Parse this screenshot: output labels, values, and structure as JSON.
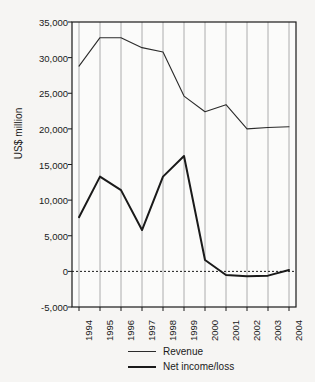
{
  "chart_data": {
    "type": "line",
    "title": "",
    "xlabel": "",
    "ylabel": "US$ million",
    "ylim": [
      -5000,
      35000
    ],
    "ytick_values": [
      35000,
      30000,
      25000,
      20000,
      15000,
      10000,
      5000,
      0,
      -5000
    ],
    "ytick_labels": [
      "35,000",
      "30,000",
      "25,000",
      "20,000",
      "15,000",
      "10,000",
      "5,000",
      "0",
      "-5,000"
    ],
    "categories": [
      "1994",
      "1995",
      "1996",
      "1997",
      "1998",
      "1999",
      "2000",
      "2001",
      "2002",
      "2003",
      "2004"
    ],
    "grid": "vertical",
    "zero_line": true,
    "legend_position": "bottom",
    "series": [
      {
        "name": "Revenue",
        "style": "thin",
        "color": "#2b2b2b",
        "values": [
          28800,
          32800,
          32800,
          31400,
          30800,
          24600,
          22400,
          23400,
          20000,
          20200,
          20300
        ]
      },
      {
        "name": "Net income/loss",
        "style": "thick",
        "color": "#1a1a1a",
        "values": [
          7600,
          13300,
          11400,
          5800,
          13300,
          16200,
          1600,
          -500,
          -700,
          -600,
          200
        ]
      }
    ]
  },
  "legend": {
    "items": [
      {
        "label": "Revenue"
      },
      {
        "label": "Net income/loss"
      }
    ]
  },
  "colors": {
    "background": "#f6f5f3",
    "plot_background": "#fbfbfa",
    "axis": "#1a1a1a",
    "gridline": "#9a9a9a",
    "revenue": "#2b2b2b",
    "net_income": "#1a1a1a"
  }
}
